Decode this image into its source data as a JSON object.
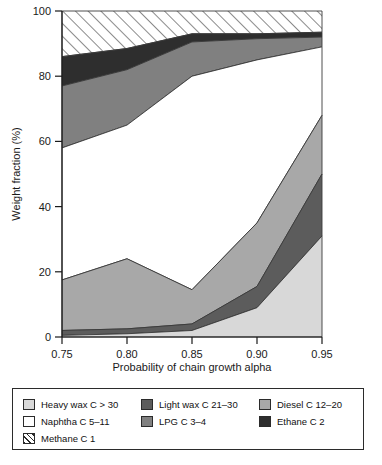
{
  "chart_data": {
    "type": "area",
    "title": "",
    "xlabel": "Probability of chain growth alpha",
    "ylabel": "Weight fraction (%)",
    "x": [
      0.75,
      0.8,
      0.85,
      0.9,
      0.95
    ],
    "xticklabels": [
      "0.75",
      "0.80",
      "0.85",
      "0.90",
      "0.95"
    ],
    "yticklabels": [
      "0",
      "20",
      "40",
      "60",
      "80",
      "100"
    ],
    "yticks": [
      0,
      20,
      40,
      60,
      80,
      100
    ],
    "xlim": [
      0.75,
      0.95
    ],
    "ylim": [
      0,
      100
    ],
    "grid": false,
    "stacked": true,
    "stack_order_bottom_to_top": [
      "Heavy wax C > 30",
      "Light wax C 21-30",
      "Diesel C 12-20",
      "Naphtha C 5-11",
      "LPG C 3-4",
      "Ethane C 2",
      "Methane C 1"
    ],
    "legend_position": "below",
    "series": [
      {
        "name": "Heavy wax C > 30",
        "values": [
          0.5,
          1.0,
          2.0,
          9.0,
          31.0
        ]
      },
      {
        "name": "Light wax C 21-30",
        "values": [
          2.0,
          2.5,
          4.0,
          15.5,
          50.0
        ]
      },
      {
        "name": "Diesel C 12-20",
        "values": [
          17.5,
          24.0,
          14.5,
          35.0,
          68.0
        ]
      },
      {
        "name": "Naphtha C 5-11",
        "values": [
          58.0,
          65.0,
          80.0,
          85.0,
          89.0
        ]
      },
      {
        "name": "LPG C 3-4",
        "values": [
          77.0,
          82.0,
          90.5,
          91.5,
          92.0
        ]
      },
      {
        "name": "Ethane C 2",
        "values": [
          86.0,
          88.5,
          93.0,
          93.0,
          93.5
        ]
      },
      {
        "name": "Methane C 1",
        "values": [
          100,
          100,
          100,
          100,
          100
        ]
      }
    ],
    "cumulative_note": "series values are cumulative upper boundaries of each stacked band in percent"
  },
  "axes": {
    "y_title": "Weight fraction (%)",
    "x_title": "Probability of chain growth alpha",
    "y_ticks": [
      "100",
      "80",
      "60",
      "40",
      "20",
      "0"
    ],
    "x_ticks": [
      "0.75",
      "0.80",
      "0.85",
      "0.90",
      "0.95"
    ]
  },
  "legend": {
    "items": [
      {
        "label": "Heavy wax C > 30",
        "color": "#d8d8d8",
        "pattern": "solid"
      },
      {
        "label": "Light wax C 21–30",
        "color": "#5c5c5c",
        "pattern": "solid"
      },
      {
        "label": "Diesel C 12–20",
        "color": "#a8a8a8",
        "pattern": "solid"
      },
      {
        "label": "Naphtha C 5–11",
        "color": "#ffffff",
        "pattern": "solid"
      },
      {
        "label": "LPG C 3–4",
        "color": "#808080",
        "pattern": "solid"
      },
      {
        "label": "Ethane C 2",
        "color": "#2e2e2e",
        "pattern": "solid"
      },
      {
        "label": "Methane C 1",
        "color": "#ffffff",
        "pattern": "hatch"
      }
    ]
  },
  "colors": {
    "heavy_wax": "#d8d8d8",
    "light_wax": "#5c5c5c",
    "diesel": "#a8a8a8",
    "naphtha": "#ffffff",
    "lpg": "#808080",
    "ethane": "#2e2e2e",
    "methane": "#ffffff",
    "axis": "#1a1a1a",
    "outline": "#3a3a3a"
  }
}
